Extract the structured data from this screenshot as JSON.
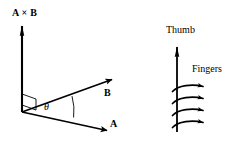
{
  "figure": {
    "background_color": "#ffffff",
    "stroke_color": "#000000",
    "width": 244,
    "height": 146
  },
  "vector_diagram": {
    "name": "cross-product-axes",
    "origin": {
      "x": 22,
      "y": 112
    },
    "labels": {
      "cross_product": "A × B",
      "vector_b": "B",
      "vector_a": "A",
      "angle": "θ"
    },
    "vectors": [
      {
        "id": "cross-product",
        "label": "A × B",
        "from": {
          "x": 22,
          "y": 112
        },
        "to": {
          "x": 22,
          "y": 24
        },
        "arrowhead": "solid-narrow"
      },
      {
        "id": "vector-b",
        "label": "B",
        "from": {
          "x": 22,
          "y": 112
        },
        "to": {
          "x": 113,
          "y": 79
        },
        "arrowhead": "solid"
      },
      {
        "id": "vector-a",
        "label": "A",
        "from": {
          "x": 22,
          "y": 112
        },
        "to": {
          "x": 108,
          "y": 131
        },
        "arrowhead": "solid"
      }
    ],
    "right_angle_marker": {
      "description": "small parallelogram at origin indicating perpendicularity",
      "points": "22,94 36,99 36,110 22,105"
    },
    "angle_arc": {
      "description": "arc spanning from vector A to vector B marking the angle theta",
      "label": "θ"
    }
  },
  "hand_diagram": {
    "name": "right-hand-illustration",
    "labels": {
      "thumb": "Thumb",
      "fingers": "Fingers"
    },
    "thumb": {
      "from": {
        "x": 177,
        "y": 132
      },
      "to": {
        "x": 177,
        "y": 45
      },
      "arrowhead": "solid-narrow"
    },
    "finger_count": 4,
    "fingers": [
      {
        "id": "finger-1",
        "start": {
          "x": 173,
          "y": 92
        },
        "end": {
          "x": 213,
          "y": 85
        }
      },
      {
        "id": "finger-2",
        "start": {
          "x": 173,
          "y": 104
        },
        "end": {
          "x": 213,
          "y": 97
        }
      },
      {
        "id": "finger-3",
        "start": {
          "x": 173,
          "y": 116
        },
        "end": {
          "x": 213,
          "y": 109
        }
      },
      {
        "id": "finger-4",
        "start": {
          "x": 173,
          "y": 128
        },
        "end": {
          "x": 213,
          "y": 121
        }
      }
    ]
  }
}
